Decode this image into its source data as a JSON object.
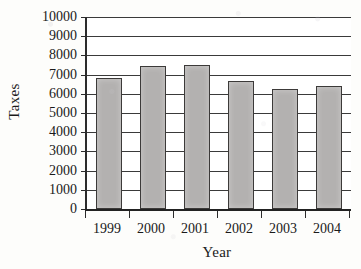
{
  "chart_data": {
    "type": "bar",
    "title": "",
    "subtitle": "",
    "xlabel": "Year",
    "ylabel": "Taxes",
    "categories": [
      "1999",
      "2000",
      "2001",
      "2002",
      "2003",
      "2004"
    ],
    "values": [
      6800,
      7450,
      7500,
      6650,
      6250,
      6400
    ],
    "ylim": [
      0,
      10000
    ],
    "ytick_step": 1000,
    "ytick_labels": [
      "10000",
      "9000",
      "8000",
      "7000",
      "6000",
      "5000",
      "4000",
      "3000",
      "2000",
      "1000",
      "0"
    ],
    "ytick_values": [
      10000,
      9000,
      8000,
      7000,
      6000,
      5000,
      4000,
      3000,
      2000,
      1000,
      0
    ],
    "grid": true,
    "grid_axis": "y",
    "legend": false,
    "legend_position": "none",
    "annotations": [],
    "series": [
      {
        "name": "Taxes",
        "values": [
          6800,
          7450,
          7500,
          6650,
          6250,
          6400
        ]
      }
    ],
    "colors": {
      "bar_fill": "#b3b1b0",
      "bar_stroke": "#3c3a39",
      "axis": "#222222",
      "gridline": "#3a3a3a",
      "plot_background": "#ffffff",
      "page_background": "#fdfdfb",
      "text": "#1a1a1a"
    }
  }
}
